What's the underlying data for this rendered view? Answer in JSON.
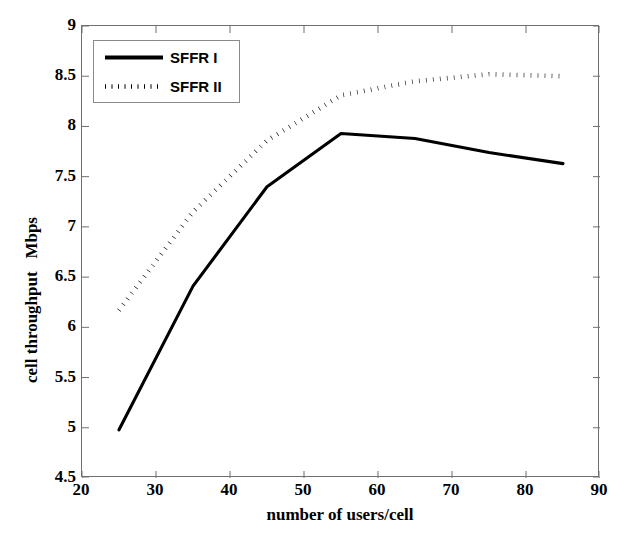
{
  "chart_data": {
    "type": "line",
    "title": "",
    "xlabel": "number of users/cell",
    "ylabel": "cell throughput   Mbps",
    "xlim": [
      20,
      90
    ],
    "ylim": [
      4.5,
      9
    ],
    "xticks": [
      20,
      30,
      40,
      50,
      60,
      70,
      80,
      90
    ],
    "yticks": [
      4.5,
      5,
      5.5,
      6,
      6.5,
      7,
      7.5,
      8,
      8.5,
      9
    ],
    "ytick_labels": [
      "4.5",
      "5",
      "5.5",
      "6",
      "6.5",
      "7",
      "7.5",
      "8",
      "8.5",
      "9"
    ],
    "xtick_labels": [
      "20",
      "30",
      "40",
      "50",
      "60",
      "70",
      "80",
      "90"
    ],
    "grid": false,
    "legend_position": "upper left",
    "x": [
      25,
      35,
      45,
      55,
      65,
      75,
      85
    ],
    "series": [
      {
        "name": "SFFR I",
        "style": "solid",
        "color": "#000000",
        "values": [
          4.98,
          6.41,
          7.4,
          7.93,
          7.88,
          7.74,
          7.63
        ]
      },
      {
        "name": "SFFR II",
        "style": "dotted",
        "color": "#000000",
        "values": [
          6.17,
          7.15,
          7.86,
          8.31,
          8.45,
          8.52,
          8.5
        ]
      }
    ]
  },
  "legend": {
    "entries": [
      {
        "label": "SFFR I",
        "style": "solid"
      },
      {
        "label": "SFFR II",
        "style": "dotted"
      }
    ]
  }
}
